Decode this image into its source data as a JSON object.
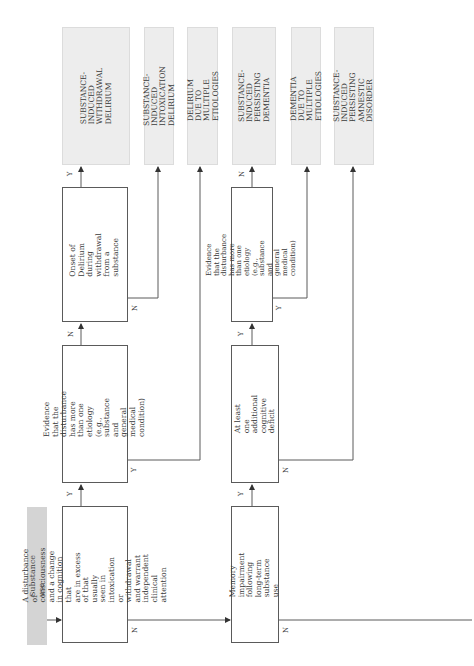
{
  "start_label": "Substance use",
  "decisions": {
    "disturbance": "A disturbance of consciousness\nand a change in cognition that\nare in excess of that usually\nseen in intoxication or\nwithdrawal and warrant\nindependent clinical attention",
    "evidence_delirium": "Evidence that the disturbance\nhas more than one etiology\n(e.g., substance and general\nmedical condition)",
    "onset_withdrawal": "Onset of Delirium during\nwithdrawal from a substance",
    "memory_impairment": "Memory impairment following\nlong-term substance use",
    "additional_deficit": "At least one additional\ncognitive deficit",
    "evidence_dementia": "Evidence that the disturbance\nhas more than one etiology\n(e.g., substance and general\nmedical condition)"
  },
  "outcomes": {
    "withdrawal_delirium": "SUBSTANCE-INDUCED\nWITHDRAWAL DELIRIUM",
    "intoxication_delirium": "SUBSTANCE-INDUCED\nINTOXICATION DELIRIUM",
    "delirium_multiple": "DELIRIUM DUE TO\nMULTIPLE ETIOLOGIES",
    "persisting_dementia": "SUBSTANCE-INDUCED\nPERSISTING DEMENTIA",
    "dementia_multiple": "DEMENTIA DUE TO\nMULTIPLE ETIOLOGIES",
    "amnestic_disorder": "SUBSTANCE-INDUCED\nPERSISTING AMNESTIC\nDISORDER"
  },
  "edge_labels": {
    "yes": "Y",
    "no": "N"
  },
  "colors": {
    "outcome_fill": "#ededed",
    "start_fill": "#d4d4d4",
    "line": "#5a5a5a"
  }
}
